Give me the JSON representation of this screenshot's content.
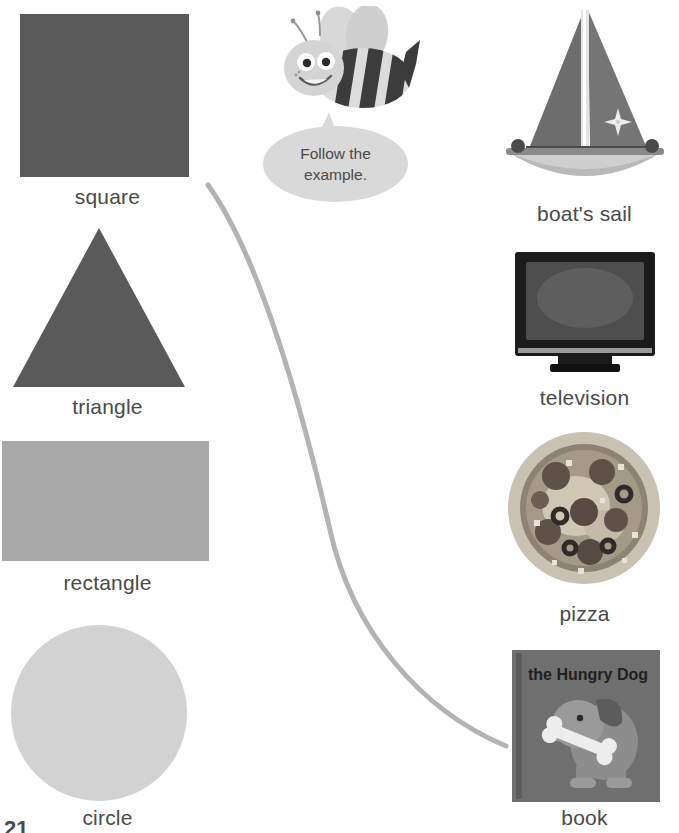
{
  "worksheet": {
    "instruction_bubble": {
      "line1": "Follow the",
      "line2": "example.",
      "full_text": "Follow the example.",
      "mascot": "bee-mascot"
    },
    "page_number": "21",
    "connector_line": {
      "color": "#b3b3b3",
      "from_item": "square",
      "to_item": "book"
    }
  },
  "left_column": {
    "items": [
      {
        "label": "square",
        "shape": "square",
        "color": "#5a5a5a"
      },
      {
        "label": "triangle",
        "shape": "triangle",
        "color": "#5a5a5a"
      },
      {
        "label": "rectangle",
        "shape": "rectangle",
        "color": "#a8a8a8"
      },
      {
        "label": "circle",
        "shape": "circle",
        "color": "#d2d2d2"
      }
    ]
  },
  "right_column": {
    "items": [
      {
        "label": "boat's sail",
        "image": "sailboat-photo"
      },
      {
        "label": "television",
        "image": "television-photo"
      },
      {
        "label": "pizza",
        "image": "pizza-photo"
      },
      {
        "label": "book",
        "image": "book-photo",
        "book_title": "the Hungry Dog"
      }
    ]
  }
}
